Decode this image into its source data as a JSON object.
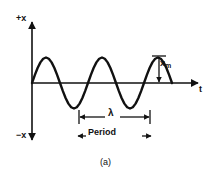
{
  "figure": {
    "caption": "(a)",
    "axis": {
      "y_axis_top_label": "+x",
      "y_axis_bottom_label": "−x",
      "x_axis_label": "t"
    },
    "annotations": {
      "amplitude_label": "x",
      "amplitude_subscript": "m",
      "wavelength_label": "λ",
      "period_label": "Period"
    },
    "colors": {
      "ink": "#111111",
      "background": "#ffffff"
    }
  },
  "chart_data": {
    "type": "line",
    "title": "",
    "subtitle": "",
    "xlabel": "t",
    "ylabel": "x",
    "grid": false,
    "legend": null,
    "annotations": [
      {
        "name": "amplitude",
        "text": "x_m",
        "kind": "vertical-double-arrow",
        "from": [
          159,
          56
        ],
        "to": [
          159,
          83
        ]
      },
      {
        "name": "wavelength",
        "text": "λ",
        "kind": "horizontal-double-arrow-with-caps",
        "from": [
          79,
          117
        ],
        "to": [
          150,
          117
        ]
      },
      {
        "name": "period",
        "text": "Period",
        "kind": "horizontal-double-arrow",
        "from": [
          78,
          136
        ],
        "to": [
          151,
          136
        ]
      },
      {
        "name": "caption",
        "text": "(a)"
      }
    ],
    "axis_ranges": {
      "x": [
        0,
        4.0
      ],
      "y": [
        -1.5,
        1.5
      ]
    },
    "series": [
      {
        "name": "sine wave",
        "equation": "x = x_m sin(2π t / T)",
        "amplitude": 1.0,
        "wavelength": 1.0,
        "cycles": 2.5,
        "x": [
          0.0,
          0.05,
          0.1,
          0.15,
          0.2,
          0.25,
          0.3,
          0.35,
          0.4,
          0.45,
          0.5,
          0.55,
          0.6,
          0.65,
          0.7,
          0.75,
          0.8,
          0.85,
          0.9,
          0.95,
          1.0,
          1.05,
          1.1,
          1.15,
          1.2,
          1.25,
          1.3,
          1.35,
          1.4,
          1.45,
          1.5,
          1.55,
          1.6,
          1.65,
          1.7,
          1.75,
          1.8,
          1.85,
          1.9,
          1.95,
          2.0,
          2.05,
          2.1,
          2.15,
          2.2,
          2.25,
          2.3,
          2.35,
          2.4,
          2.45,
          2.5
        ],
        "y": [
          0.0,
          0.309,
          0.588,
          0.809,
          0.951,
          1.0,
          0.951,
          0.809,
          0.588,
          0.309,
          0.0,
          -0.309,
          -0.588,
          -0.809,
          -0.951,
          -1.0,
          -0.951,
          -0.809,
          -0.588,
          -0.309,
          0.0,
          0.309,
          0.588,
          0.809,
          0.951,
          1.0,
          0.951,
          0.809,
          0.588,
          0.309,
          0.0,
          -0.309,
          -0.588,
          -0.809,
          -0.951,
          -1.0,
          -0.951,
          -0.809,
          -0.588,
          -0.309,
          0.0,
          0.309,
          0.588,
          0.809,
          0.951,
          1.0,
          0.951,
          0.809,
          0.588,
          0.309,
          0.0
        ]
      }
    ]
  }
}
